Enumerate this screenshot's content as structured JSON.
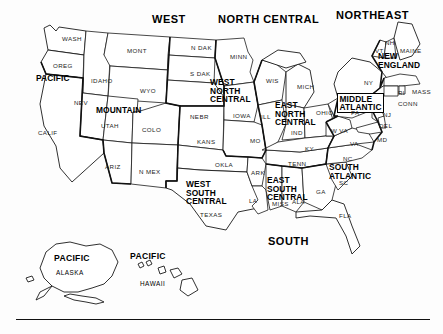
{
  "figure": {
    "kind": "us-census-regions-map",
    "background_color": "#fdfdfd",
    "ink_color": "#111111"
  },
  "regions_top": [
    {
      "id": "west",
      "label": "WEST",
      "x": 152,
      "y": 14
    },
    {
      "id": "north-central",
      "label": "NORTH CENTRAL",
      "x": 218,
      "y": 14
    },
    {
      "id": "northeast",
      "label": "NORTHEAST",
      "x": 336,
      "y": 10
    },
    {
      "id": "south",
      "label": "SOUTH",
      "x": 268,
      "y": 236
    }
  ],
  "divisions": [
    {
      "id": "pacific",
      "label": "PACIFIC",
      "x": 36,
      "y": 74,
      "boxed": false
    },
    {
      "id": "mountain",
      "label": "MOUNTAIN",
      "x": 96,
      "y": 106,
      "boxed": false
    },
    {
      "id": "west-north-central",
      "label": "WEST\nNORTH\nCENTRAL",
      "x": 210,
      "y": 78,
      "boxed": false
    },
    {
      "id": "east-north-central",
      "label": "EAST\nNORTH\nCENTRAL",
      "x": 275,
      "y": 101,
      "boxed": false
    },
    {
      "id": "middle-atlantic",
      "label": "MIDDLE\nATLANTIC",
      "x": 337,
      "y": 93,
      "boxed": true
    },
    {
      "id": "new-england",
      "label": "NEW\nENGLAND",
      "x": 378,
      "y": 52,
      "boxed": false
    },
    {
      "id": "west-south-central",
      "label": "WEST\nSOUTH\nCENTRAL",
      "x": 186,
      "y": 180,
      "boxed": false
    },
    {
      "id": "east-south-central",
      "label": "EAST\nSOUTH\nCENTRAL",
      "x": 267,
      "y": 176,
      "boxed": false
    },
    {
      "id": "south-atlantic",
      "label": "SOUTH\nATLANTIC",
      "x": 329,
      "y": 163,
      "boxed": false
    }
  ],
  "states": [
    {
      "id": "wash",
      "label": "WASH",
      "x": 62,
      "y": 36
    },
    {
      "id": "oreg",
      "label": "OREG",
      "x": 53,
      "y": 63
    },
    {
      "id": "calif",
      "label": "CALIF",
      "x": 38,
      "y": 130
    },
    {
      "id": "nev",
      "label": "NEV",
      "x": 74,
      "y": 100
    },
    {
      "id": "idaho",
      "label": "IDAHO",
      "x": 91,
      "y": 78
    },
    {
      "id": "mont",
      "label": "MONT",
      "x": 127,
      "y": 48
    },
    {
      "id": "wyo",
      "label": "WYO",
      "x": 140,
      "y": 88
    },
    {
      "id": "utah",
      "label": "UTAH",
      "x": 101,
      "y": 123
    },
    {
      "id": "colo",
      "label": "COLO",
      "x": 142,
      "y": 127
    },
    {
      "id": "ariz",
      "label": "ARIZ",
      "x": 105,
      "y": 164
    },
    {
      "id": "nmex",
      "label": "N MEX",
      "x": 139,
      "y": 169
    },
    {
      "id": "ndak",
      "label": "N DAK",
      "x": 191,
      "y": 45
    },
    {
      "id": "sdak",
      "label": "S DAK",
      "x": 190,
      "y": 71
    },
    {
      "id": "nebr",
      "label": "NEBR",
      "x": 190,
      "y": 114
    },
    {
      "id": "kans",
      "label": "KANS",
      "x": 197,
      "y": 139
    },
    {
      "id": "minn",
      "label": "MINN",
      "x": 230,
      "y": 54
    },
    {
      "id": "iowa",
      "label": "IOWA",
      "x": 233,
      "y": 113
    },
    {
      "id": "mo",
      "label": "MO",
      "x": 250,
      "y": 138
    },
    {
      "id": "wis",
      "label": "WIS",
      "x": 266,
      "y": 78
    },
    {
      "id": "ill",
      "label": "ILL",
      "x": 261,
      "y": 114
    },
    {
      "id": "mich",
      "label": "MICH",
      "x": 297,
      "y": 84
    },
    {
      "id": "ind",
      "label": "IND",
      "x": 291,
      "y": 130
    },
    {
      "id": "ohio",
      "label": "OHIO",
      "x": 316,
      "y": 110
    },
    {
      "id": "okla",
      "label": "OKLA",
      "x": 215,
      "y": 162
    },
    {
      "id": "texas",
      "label": "TEXAS",
      "x": 200,
      "y": 212
    },
    {
      "id": "ark",
      "label": "ARK",
      "x": 251,
      "y": 170
    },
    {
      "id": "la",
      "label": "LA",
      "x": 249,
      "y": 198
    },
    {
      "id": "miss",
      "label": "MISS",
      "x": 272,
      "y": 201
    },
    {
      "id": "ala",
      "label": "ALA",
      "x": 292,
      "y": 199
    },
    {
      "id": "tenn",
      "label": "TENN",
      "x": 288,
      "y": 161
    },
    {
      "id": "ky",
      "label": "KY",
      "x": 305,
      "y": 146
    },
    {
      "id": "ga",
      "label": "GA",
      "x": 316,
      "y": 189
    },
    {
      "id": "fla",
      "label": "FLA",
      "x": 339,
      "y": 213
    },
    {
      "id": "sc",
      "label": "SC",
      "x": 339,
      "y": 180
    },
    {
      "id": "nc",
      "label": "NC",
      "x": 343,
      "y": 156
    },
    {
      "id": "va",
      "label": "VA",
      "x": 350,
      "y": 141
    },
    {
      "id": "wva",
      "label": "W VA",
      "x": 331,
      "y": 128
    },
    {
      "id": "md",
      "label": "MD",
      "x": 377,
      "y": 137
    },
    {
      "id": "del",
      "label": "DEL",
      "x": 379,
      "y": 123
    },
    {
      "id": "nj",
      "label": "NJ",
      "x": 383,
      "y": 112
    },
    {
      "id": "pa",
      "label": "PA",
      "x": 351,
      "y": 110
    },
    {
      "id": "ny",
      "label": "NY",
      "x": 364,
      "y": 80
    },
    {
      "id": "conn",
      "label": "CONN",
      "x": 398,
      "y": 101
    },
    {
      "id": "ri",
      "label": "RI",
      "x": 398,
      "y": 90
    },
    {
      "id": "mass",
      "label": "MASS",
      "x": 412,
      "y": 89
    },
    {
      "id": "vt",
      "label": "VT",
      "x": 375,
      "y": 48
    },
    {
      "id": "nh",
      "label": "NH",
      "x": 385,
      "y": 40
    },
    {
      "id": "maine",
      "label": "MAINE",
      "x": 400,
      "y": 48
    }
  ],
  "insets": [
    {
      "id": "alaska",
      "division_label": "PACIFIC",
      "state_label": "ALASKA",
      "division_x": 54,
      "division_y": 254,
      "state_x": 56,
      "state_y": 270
    },
    {
      "id": "hawaii",
      "division_label": "PACIFIC",
      "state_label": "HAWAII",
      "division_x": 130,
      "division_y": 252,
      "state_x": 140,
      "state_y": 281
    }
  ],
  "footer_rule": {
    "present": true
  }
}
